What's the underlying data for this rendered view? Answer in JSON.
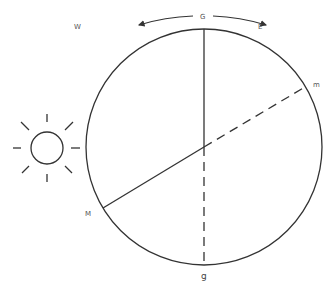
{
  "diagram": {
    "type": "earth-sun-geometry",
    "colors": {
      "stroke": "#333333",
      "label": "#555555",
      "background": "#ffffff"
    },
    "labels": {
      "top": "G",
      "west": "W",
      "east": "E",
      "right": "m",
      "left": "M",
      "bottom": "g"
    },
    "icons": {
      "sun": "sun-icon",
      "west_arrow": "arrow-left-icon",
      "east_arrow": "arrow-right-icon"
    },
    "circle": {
      "cx": 204,
      "cy": 147,
      "r": 118
    }
  }
}
